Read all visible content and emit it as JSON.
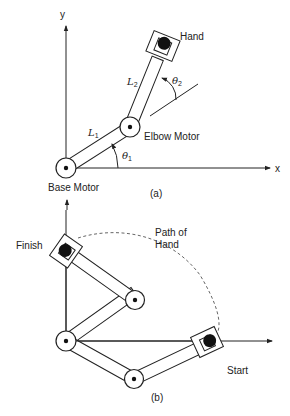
{
  "figure_a": {
    "caption": "(a)",
    "axis_x_label": "x",
    "axis_y_label": "y",
    "labels": {
      "hand": "Hand",
      "elbow_motor": "Elbow Motor",
      "base_motor": "Base Motor",
      "link1": "L",
      "link1_sub": "1",
      "link2": "L",
      "link2_sub": "2",
      "theta1": "θ",
      "theta1_sub": "1",
      "theta2": "θ",
      "theta2_sub": "2"
    }
  },
  "figure_b": {
    "caption": "(b)",
    "labels": {
      "finish": "Finish",
      "start": "Start",
      "path_line1": "Path of",
      "path_line2": "Hand"
    }
  },
  "colors": {
    "stroke": "#222222",
    "background": "#ffffff",
    "path": "#555555"
  }
}
